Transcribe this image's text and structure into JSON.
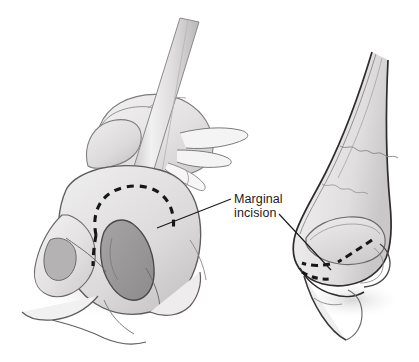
{
  "figure": {
    "title": "Marginal incision",
    "background_color": "#ffffff",
    "width": 419,
    "height": 362,
    "type": "medical-illustration",
    "views": [
      {
        "name": "basal-view",
        "description": "Worm's-eye / basal view of nose with retractor held by gloved hand everting the nostril rim, dashed marginal incision outlined along caudal border of lower lateral cartilage"
      },
      {
        "name": "lateral-view",
        "description": "Lateral profile view of nose showing underlying cartilage framework with dashed marginal incision along the caudal margin of the lower lateral cartilage"
      }
    ]
  },
  "annotations": {
    "marginal_incision": {
      "line1": "Marginal",
      "line2": "incision",
      "text_x": 234,
      "text_y": 203,
      "color": "#1b1b1b",
      "leaders": [
        {
          "name": "leader-to-basal-view",
          "from_x": 231,
          "from_y": 199,
          "to_x": 157,
          "to_y": 228
        },
        {
          "name": "leader-to-lateral-view",
          "from_x": 279,
          "from_y": 214,
          "to_x": 331,
          "to_y": 270
        }
      ]
    }
  },
  "palette": {
    "background": "#ffffff",
    "ink_dark": "#2c2c2c",
    "ink_mid": "#6e6e6e",
    "ink_light": "#a8a8a8",
    "skin_light": "#eceaea",
    "skin_mid": "#dddbdb",
    "skin_shadow": "#c6c4c4",
    "nostril_fill": "#9a9a9a",
    "cartilage_fill": "#d2d0d0",
    "metal_light": "#efeeee",
    "metal_mid": "#cfcdcd",
    "incision_dash": "#171717"
  },
  "elements": {
    "retractor": "surgical retractor blade",
    "hand": "gloved surgeon hand",
    "nostril": "nostril aperture",
    "ala": "nasal ala",
    "columella": "columella",
    "dorsum": "nasal dorsum",
    "upper_lateral_cartilage": "upper lateral cartilage",
    "lower_lateral_cartilage": "lower lateral cartilage"
  }
}
